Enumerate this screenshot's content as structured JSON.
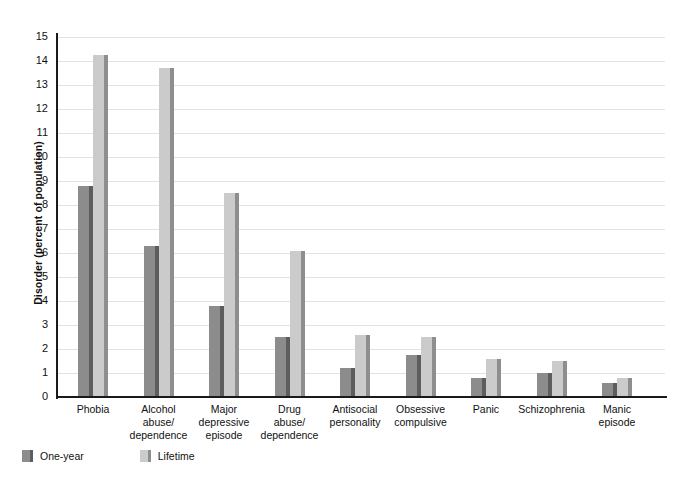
{
  "chart_data": {
    "type": "bar",
    "title": "",
    "xlabel": "",
    "ylabel": "Disorder (percent of population)",
    "ylim": [
      0,
      15
    ],
    "ytick_step": 1,
    "grid": true,
    "legend_position": "bottom-left",
    "categories": [
      "Phobia",
      "Alcohol abuse/ dependence",
      "Major depressive episode",
      "Drug abuse/ dependence",
      "Antisocial personality",
      "Obsessive compulsive",
      "Panic",
      "Schizophrenia",
      "Manic episode"
    ],
    "category_lines": [
      [
        "Phobia"
      ],
      [
        "Alcohol",
        "abuse/",
        "dependence"
      ],
      [
        "Major",
        "depressive",
        "episode"
      ],
      [
        "Drug",
        "abuse/",
        "dependence"
      ],
      [
        "Antisocial",
        "personality"
      ],
      [
        "Obsessive",
        "compulsive"
      ],
      [
        "Panic"
      ],
      [
        "Schizophrenia"
      ],
      [
        "Manic",
        "episode"
      ]
    ],
    "ytick_labels": [
      "15",
      "14",
      "13",
      "12",
      "11",
      "10",
      "9",
      "8",
      "7",
      "6",
      "5",
      "4",
      "3",
      "2",
      "1",
      "0"
    ],
    "series": [
      {
        "name": "One-year",
        "color": "#8c8c8c",
        "shadow_color": "#5d5d5d",
        "values": [
          8.8,
          6.3,
          3.8,
          2.5,
          1.2,
          1.75,
          0.8,
          1.0,
          0.6
        ]
      },
      {
        "name": "Lifetime",
        "color": "#cbcbcb",
        "shadow_color": "#8e8e8e",
        "values": [
          14.25,
          13.7,
          8.5,
          6.1,
          2.6,
          2.5,
          1.6,
          1.5,
          0.8
        ]
      }
    ]
  },
  "legend": {
    "items": [
      {
        "label": "One-year"
      },
      {
        "label": "Lifetime"
      }
    ]
  },
  "colors": {
    "one_year": "#8c8c8c",
    "lifetime": "#cbcbcb",
    "gridline": "#e3e3e3",
    "axis": "#1a1a1a",
    "background": "#ffffff"
  }
}
